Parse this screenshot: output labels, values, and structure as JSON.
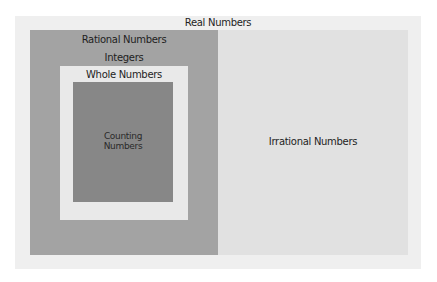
{
  "diagram": {
    "type": "nested-set-diagram",
    "title": "Real Numbers",
    "sets": {
      "real": {
        "label": "Real Numbers",
        "color": "#efefef"
      },
      "rational": {
        "label": "Rational Numbers",
        "color": "#a3a3a3"
      },
      "integers": {
        "label": "Integers"
      },
      "whole": {
        "label": "Whole Numbers",
        "color": "#e9e9e9"
      },
      "counting": {
        "label_line1": "Counting",
        "label_line2": "Numbers",
        "color": "#878787"
      },
      "irrational": {
        "label": "Irrational Numbers",
        "color": "#e1e1e1"
      }
    }
  }
}
